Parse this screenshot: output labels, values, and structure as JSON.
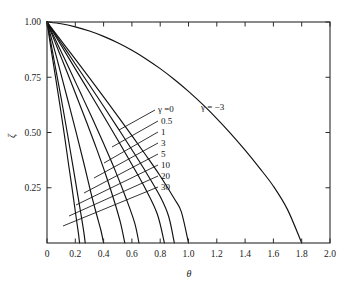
{
  "chart_data": {
    "type": "line",
    "title": "",
    "subtitle": "",
    "xlabel": "θ",
    "ylabel": "ζ",
    "xlim": [
      0,
      2.0
    ],
    "ylim": [
      0,
      1.0
    ],
    "grid": false,
    "legend_position": "inline-leader-labels",
    "xticks": [
      "0",
      "0.2",
      "0.4",
      "0.6",
      "0.8",
      "1.0",
      "1.2",
      "1.4",
      "1.6",
      "1.8",
      "2.0"
    ],
    "xtick_values": [
      0,
      0.2,
      0.4,
      0.6,
      0.8,
      1.0,
      1.2,
      1.4,
      1.6,
      1.8,
      2.0
    ],
    "yticks": [
      "0.25",
      "0.50",
      "0.75",
      "1.00"
    ],
    "ytick_values": [
      0.25,
      0.5,
      0.75,
      1.0
    ],
    "curve_color": "#111111",
    "axis_color": "#2b2b2b",
    "series": [
      {
        "name": "γ = −3",
        "gamma": -3,
        "label": "γ = −3",
        "x_intercept": 1.8,
        "x": [
          0.0,
          0.1,
          0.2,
          0.3,
          0.4,
          0.5,
          0.6,
          0.7,
          0.8,
          0.9,
          1.0,
          1.1,
          1.2,
          1.3,
          1.4,
          1.5,
          1.6,
          1.7,
          1.8
        ],
        "values": [
          1.0,
          0.992,
          0.978,
          0.959,
          0.935,
          0.906,
          0.872,
          0.833,
          0.789,
          0.74,
          0.686,
          0.627,
          0.563,
          0.494,
          0.42,
          0.341,
          0.257,
          0.151,
          0.0
        ]
      },
      {
        "name": "γ = 0",
        "gamma": 0,
        "label": "γ =0",
        "x_intercept": 1.0,
        "x": [
          0.0,
          0.05,
          0.1,
          0.15,
          0.2,
          0.3,
          0.4,
          0.5,
          0.6,
          0.7,
          0.8,
          0.9,
          0.95,
          1.0
        ],
        "values": [
          1.0,
          0.958,
          0.916,
          0.874,
          0.832,
          0.747,
          0.661,
          0.574,
          0.486,
          0.396,
          0.303,
          0.2,
          0.14,
          0.0
        ]
      },
      {
        "name": "γ = 0.5",
        "gamma": 0.5,
        "label": "0.5",
        "x_intercept": 0.9,
        "x": [
          0.0,
          0.05,
          0.1,
          0.15,
          0.2,
          0.3,
          0.4,
          0.5,
          0.6,
          0.7,
          0.8,
          0.86,
          0.9
        ],
        "values": [
          1.0,
          0.952,
          0.905,
          0.858,
          0.81,
          0.715,
          0.619,
          0.521,
          0.422,
          0.32,
          0.21,
          0.12,
          0.0
        ]
      },
      {
        "name": "γ = 1",
        "gamma": 1,
        "label": "1",
        "x_intercept": 0.83,
        "x": [
          0.0,
          0.05,
          0.1,
          0.15,
          0.2,
          0.3,
          0.4,
          0.5,
          0.6,
          0.7,
          0.78,
          0.83
        ],
        "values": [
          1.0,
          0.947,
          0.894,
          0.841,
          0.788,
          0.682,
          0.575,
          0.466,
          0.355,
          0.24,
          0.13,
          0.0
        ]
      },
      {
        "name": "γ = 3",
        "gamma": 3,
        "label": "3",
        "x_intercept": 0.65,
        "x": [
          0.0,
          0.04,
          0.08,
          0.12,
          0.16,
          0.24,
          0.32,
          0.4,
          0.48,
          0.56,
          0.62,
          0.65
        ],
        "values": [
          1.0,
          0.946,
          0.893,
          0.839,
          0.785,
          0.675,
          0.564,
          0.45,
          0.331,
          0.2,
          0.09,
          0.0
        ]
      },
      {
        "name": "γ = 5",
        "gamma": 5,
        "label": "5",
        "x_intercept": 0.55,
        "x": [
          0.0,
          0.035,
          0.07,
          0.105,
          0.14,
          0.21,
          0.28,
          0.35,
          0.42,
          0.48,
          0.52,
          0.55
        ],
        "values": [
          1.0,
          0.944,
          0.888,
          0.832,
          0.776,
          0.662,
          0.546,
          0.427,
          0.3,
          0.18,
          0.09,
          0.0
        ]
      },
      {
        "name": "γ = 10",
        "gamma": 10,
        "label": "10",
        "x_intercept": 0.4,
        "x": [
          0.0,
          0.025,
          0.05,
          0.08,
          0.11,
          0.16,
          0.21,
          0.26,
          0.31,
          0.35,
          0.38,
          0.4
        ],
        "values": [
          1.0,
          0.941,
          0.882,
          0.81,
          0.737,
          0.615,
          0.49,
          0.362,
          0.228,
          0.13,
          0.06,
          0.0
        ]
      },
      {
        "name": "γ = 20",
        "gamma": 20,
        "label": "20",
        "x_intercept": 0.27,
        "x": [
          0.0,
          0.018,
          0.036,
          0.055,
          0.075,
          0.11,
          0.145,
          0.18,
          0.21,
          0.24,
          0.26,
          0.27
        ],
        "values": [
          1.0,
          0.938,
          0.876,
          0.81,
          0.742,
          0.62,
          0.492,
          0.36,
          0.245,
          0.13,
          0.05,
          0.0
        ]
      },
      {
        "name": "γ = 30",
        "gamma": 30,
        "label": "30",
        "x_intercept": 0.23,
        "x": [
          0.0,
          0.015,
          0.03,
          0.047,
          0.064,
          0.094,
          0.124,
          0.153,
          0.18,
          0.205,
          0.222,
          0.23
        ],
        "values": [
          1.0,
          0.936,
          0.872,
          0.804,
          0.735,
          0.612,
          0.484,
          0.353,
          0.235,
          0.12,
          0.045,
          0.0
        ]
      }
    ],
    "annotations": [
      {
        "text": "γ =0",
        "for": "γ = 0"
      },
      {
        "text": "0.5",
        "for": "γ = 0.5"
      },
      {
        "text": "1",
        "for": "γ = 1"
      },
      {
        "text": "3",
        "for": "γ = 3"
      },
      {
        "text": "5",
        "for": "γ = 5"
      },
      {
        "text": "10",
        "for": "γ = 10"
      },
      {
        "text": "20",
        "for": "γ = 20"
      },
      {
        "text": "30",
        "for": "γ = 30"
      },
      {
        "text": "γ = −3",
        "for": "γ = −3"
      }
    ]
  }
}
